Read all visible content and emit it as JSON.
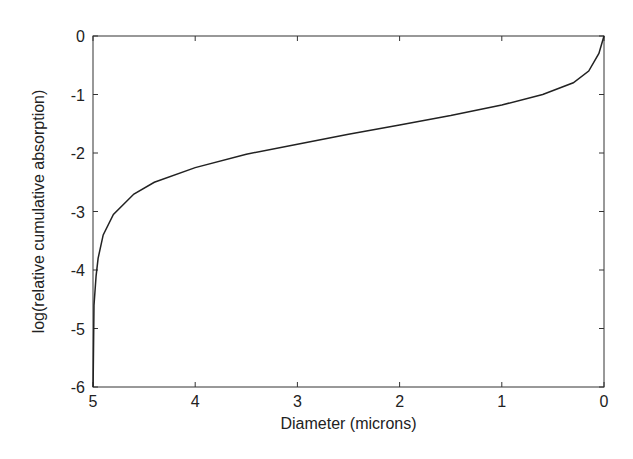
{
  "chart_data": {
    "type": "line",
    "title": "",
    "xlabel": "Diameter (microns)",
    "ylabel": "log(relative cumulative absorption)",
    "xlim": [
      5,
      0
    ],
    "ylim": [
      -6,
      0
    ],
    "x_reversed": true,
    "xticks": [
      5,
      4,
      3,
      2,
      1,
      0
    ],
    "yticks": [
      0,
      -1,
      -2,
      -3,
      -4,
      -5,
      -6
    ],
    "grid": false,
    "series": [
      {
        "name": "curve",
        "x": [
          4.999,
          4.99,
          4.97,
          4.95,
          4.9,
          4.8,
          4.6,
          4.4,
          4.0,
          3.5,
          3.0,
          2.5,
          2.0,
          1.5,
          1.0,
          0.6,
          0.3,
          0.15,
          0.05,
          0.0
        ],
        "y": [
          -6.0,
          -4.6,
          -4.1,
          -3.8,
          -3.4,
          -3.05,
          -2.7,
          -2.5,
          -2.25,
          -2.02,
          -1.85,
          -1.68,
          -1.52,
          -1.36,
          -1.18,
          -1.0,
          -0.8,
          -0.6,
          -0.3,
          0.0
        ]
      }
    ]
  }
}
